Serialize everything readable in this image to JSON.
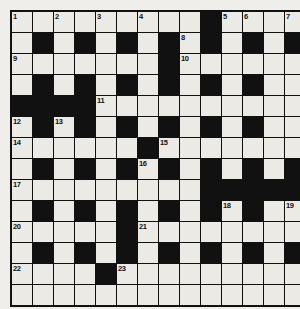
{
  "puzzle": {
    "type": "crossword-grid",
    "title": "Crossword Puzzle Grid",
    "columns": 14,
    "rows": 14,
    "cell_size_px": 20,
    "colors": {
      "page_background": "#efeeea",
      "white_cell": "#eceae4",
      "black_cell": "#111111",
      "grid_line": "#111111",
      "number_text": "#111111"
    },
    "legend": {
      "white": "open letter square",
      "black": "blocked square"
    },
    "grid": [
      [
        "W",
        "W",
        "W",
        "W",
        "W",
        "W",
        "W",
        "W",
        "W",
        "B",
        "W",
        "W",
        "W",
        "W"
      ],
      [
        "W",
        "B",
        "W",
        "B",
        "W",
        "B",
        "W",
        "B",
        "W",
        "B",
        "W",
        "B",
        "W",
        "B"
      ],
      [
        "W",
        "W",
        "W",
        "W",
        "W",
        "W",
        "W",
        "B",
        "W",
        "W",
        "W",
        "W",
        "W",
        "W"
      ],
      [
        "W",
        "B",
        "W",
        "B",
        "W",
        "B",
        "W",
        "B",
        "W",
        "B",
        "W",
        "B",
        "W",
        "W"
      ],
      [
        "B",
        "B",
        "B",
        "B",
        "W",
        "W",
        "W",
        "W",
        "W",
        "W",
        "W",
        "W",
        "W",
        "W"
      ],
      [
        "W",
        "B",
        "W",
        "B",
        "W",
        "B",
        "W",
        "B",
        "W",
        "B",
        "W",
        "B",
        "W",
        "W"
      ],
      [
        "W",
        "W",
        "W",
        "W",
        "W",
        "W",
        "B",
        "W",
        "W",
        "W",
        "W",
        "W",
        "W",
        "W"
      ],
      [
        "W",
        "B",
        "W",
        "B",
        "W",
        "B",
        "W",
        "B",
        "W",
        "B",
        "W",
        "B",
        "W",
        "B"
      ],
      [
        "W",
        "W",
        "W",
        "W",
        "W",
        "W",
        "W",
        "W",
        "W",
        "B",
        "B",
        "B",
        "B",
        "B"
      ],
      [
        "W",
        "B",
        "W",
        "B",
        "W",
        "B",
        "W",
        "B",
        "W",
        "B",
        "W",
        "B",
        "W",
        "W"
      ],
      [
        "W",
        "W",
        "W",
        "W",
        "W",
        "B",
        "W",
        "W",
        "W",
        "W",
        "W",
        "W",
        "W",
        "W"
      ],
      [
        "W",
        "B",
        "W",
        "B",
        "W",
        "B",
        "W",
        "B",
        "W",
        "B",
        "W",
        "B",
        "W",
        "B"
      ],
      [
        "W",
        "W",
        "W",
        "W",
        "B",
        "W",
        "W",
        "W",
        "W",
        "W",
        "W",
        "W",
        "W",
        "W"
      ],
      [
        "W",
        "W",
        "W",
        "W",
        "W",
        "W",
        "W",
        "W",
        "W",
        "W",
        "W",
        "W",
        "W",
        "W"
      ]
    ],
    "numbers": [
      {
        "n": "1",
        "row": 0,
        "col": 0
      },
      {
        "n": "2",
        "row": 0,
        "col": 2
      },
      {
        "n": "3",
        "row": 0,
        "col": 4
      },
      {
        "n": "4",
        "row": 0,
        "col": 6
      },
      {
        "n": "5",
        "row": 0,
        "col": 10
      },
      {
        "n": "6",
        "row": 0,
        "col": 11
      },
      {
        "n": "7",
        "row": 0,
        "col": 13
      },
      {
        "n": "8",
        "row": 1,
        "col": 8
      },
      {
        "n": "9",
        "row": 2,
        "col": 0
      },
      {
        "n": "10",
        "row": 2,
        "col": 8
      },
      {
        "n": "11",
        "row": 4,
        "col": 4
      },
      {
        "n": "12",
        "row": 5,
        "col": 0
      },
      {
        "n": "13",
        "row": 5,
        "col": 2
      },
      {
        "n": "14",
        "row": 6,
        "col": 0
      },
      {
        "n": "15",
        "row": 6,
        "col": 7
      },
      {
        "n": "16",
        "row": 7,
        "col": 6
      },
      {
        "n": "17",
        "row": 8,
        "col": 0
      },
      {
        "n": "18",
        "row": 9,
        "col": 10
      },
      {
        "n": "19",
        "row": 9,
        "col": 13
      },
      {
        "n": "20",
        "row": 10,
        "col": 0
      },
      {
        "n": "21",
        "row": 10,
        "col": 6
      },
      {
        "n": "22",
        "row": 12,
        "col": 0
      },
      {
        "n": "23",
        "row": 12,
        "col": 5
      }
    ]
  }
}
